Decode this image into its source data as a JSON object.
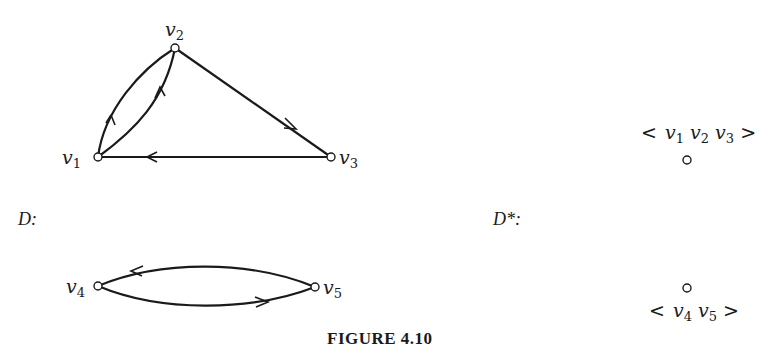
{
  "figure": {
    "caption": "FIGURE 4.10",
    "left_graph": {
      "label": "D:",
      "nodes": [
        {
          "id": "v1",
          "name": "v",
          "sub": "1",
          "x": 98,
          "y": 157
        },
        {
          "id": "v2",
          "name": "v",
          "sub": "2",
          "x": 175,
          "y": 48
        },
        {
          "id": "v3",
          "name": "v",
          "sub": "3",
          "x": 331,
          "y": 157
        },
        {
          "id": "v4",
          "name": "v",
          "sub": "4",
          "x": 98,
          "y": 286
        },
        {
          "id": "v5",
          "name": "v",
          "sub": "5",
          "x": 315,
          "y": 287
        }
      ],
      "edges": [
        {
          "from": "v2",
          "to": "v1",
          "shape": "curve-left"
        },
        {
          "from": "v1",
          "to": "v2",
          "shape": "curve-right"
        },
        {
          "from": "v2",
          "to": "v3",
          "shape": "straight"
        },
        {
          "from": "v3",
          "to": "v1",
          "shape": "straight"
        },
        {
          "from": "v5",
          "to": "v4",
          "shape": "curve-top"
        },
        {
          "from": "v4",
          "to": "v5",
          "shape": "curve-bottom"
        }
      ]
    },
    "right_graph": {
      "label": "D*:",
      "nodes": [
        {
          "id": "c1",
          "label_open": "<",
          "members": [
            "1",
            "2",
            "3"
          ],
          "label_close": ">",
          "x": 687,
          "y": 160
        },
        {
          "id": "c2",
          "label_open": "<",
          "members": [
            "4",
            "5"
          ],
          "label_close": ">",
          "x": 687,
          "y": 288
        }
      ],
      "edges": []
    }
  }
}
